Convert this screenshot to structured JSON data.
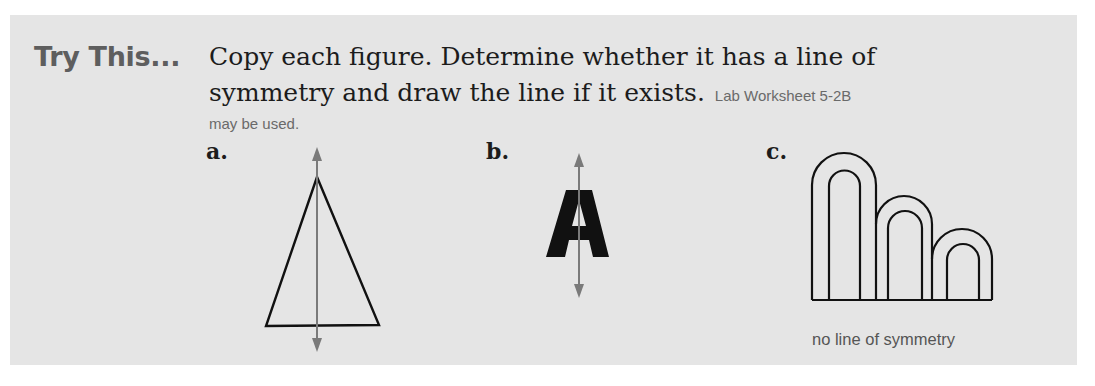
{
  "exercise": {
    "heading": "Try This...",
    "instruction_line1": "Copy each figure. Determine whether it has a line of",
    "instruction_line2": "symmetry and draw the line if it exists.",
    "note_part1": "Lab Worksheet 5-2B",
    "note_part2": "may be used."
  },
  "figures": [
    {
      "label": "a.",
      "shape": "isosceles-triangle",
      "has_symmetry_line": true
    },
    {
      "label": "b.",
      "shape": "letter",
      "glyph": "A",
      "has_symmetry_line": true
    },
    {
      "label": "c.",
      "shape": "three-nested-arches",
      "has_symmetry_line": false,
      "caption": "no line of symmetry"
    }
  ],
  "colors": {
    "panel_bg": "#e5e5e5",
    "heading": "#5e5e5e",
    "symmetry_line": "#7a7a7a",
    "outline": "#111111"
  }
}
